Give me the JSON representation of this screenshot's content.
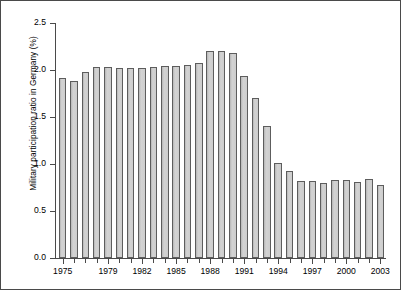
{
  "chart": {
    "ylabel": "Military participation ratio in Germany (%)",
    "xlabel": "",
    "title": ""
  },
  "axis": {
    "y_ticks": [
      "0.0",
      "0.5",
      "1.0",
      "1.5",
      "2.0",
      "2.5"
    ],
    "x_ticks": [
      "1975",
      "1979",
      "1982",
      "1985",
      "1988",
      "1991",
      "1994",
      "1997",
      "2000",
      "2003"
    ]
  },
  "colors": {
    "bar_fill": "#c9c9c9",
    "bar_stroke": "#5d5d5d",
    "axis": "#4a4a4a",
    "frame": "#4a4a4a",
    "background": "#ffffff",
    "text": "#000000"
  },
  "chart_data": {
    "type": "bar",
    "title": "",
    "xlabel": "",
    "ylabel": "Military participation ratio in Germany (%)",
    "ylim": [
      0.0,
      2.5
    ],
    "ytick_values": [
      0.0,
      0.5,
      1.0,
      1.5,
      2.0,
      2.5
    ],
    "xtick_labels": [
      "1975",
      "1979",
      "1982",
      "1985",
      "1988",
      "1991",
      "1994",
      "1997",
      "2000",
      "2003"
    ],
    "grid": false,
    "legend": false,
    "categories": [
      "1975",
      "1976",
      "1977",
      "1978",
      "1979",
      "1980",
      "1981",
      "1982",
      "1983",
      "1984",
      "1985",
      "1986",
      "1987",
      "1988",
      "1989",
      "1990",
      "1991",
      "1992",
      "1993",
      "1994",
      "1995",
      "1996",
      "1997",
      "1998",
      "1999",
      "2000",
      "2001",
      "2002",
      "2003"
    ],
    "values": [
      1.91,
      1.88,
      1.98,
      2.03,
      2.03,
      2.02,
      2.02,
      2.02,
      2.03,
      2.04,
      2.04,
      2.05,
      2.07,
      2.2,
      2.2,
      2.18,
      1.94,
      1.7,
      1.4,
      1.01,
      0.93,
      0.82,
      0.82,
      0.8,
      0.83,
      0.83,
      0.81,
      0.84,
      0.78
    ]
  }
}
